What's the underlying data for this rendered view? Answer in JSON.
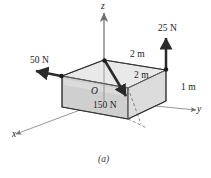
{
  "figure": {
    "caption": "(a)",
    "origin_label": "O"
  },
  "axes": [
    {
      "name": "x-axis",
      "label": "x"
    },
    {
      "name": "y-axis",
      "label": "y"
    },
    {
      "name": "z-axis",
      "label": "z"
    }
  ],
  "forces": [
    {
      "name": "force-50n",
      "label": "50 N",
      "magnitude": 50,
      "unit": "N",
      "direction": "negative-x-horizontal-left"
    },
    {
      "name": "force-25n",
      "label": "25 N",
      "magnitude": 25,
      "unit": "N",
      "direction": "positive-z-up"
    },
    {
      "name": "force-150n",
      "label": "150 N",
      "magnitude": 150,
      "unit": "N",
      "direction": "diagonal-down-toward-front-right"
    }
  ],
  "dimensions": [
    {
      "name": "dim-top-rear",
      "label": "2 m",
      "value": 2,
      "unit": "m"
    },
    {
      "name": "dim-top-front",
      "label": "2 m",
      "value": 2,
      "unit": "m"
    },
    {
      "name": "dim-height",
      "label": "1 m",
      "value": 1,
      "unit": "m"
    }
  ],
  "colors": {
    "line": "#1a1a1a",
    "axis": "#6e6e6e",
    "face_top": "#e8e8e8",
    "face_front": "#d2d2d2",
    "face_right": "#c4c4c4",
    "background": "#ffffff"
  }
}
